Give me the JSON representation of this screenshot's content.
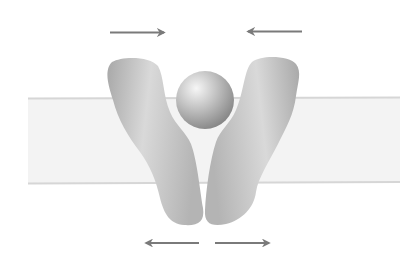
{
  "diagram": {
    "colors": {
      "background": "#ffffff",
      "membrane_fill": "#f3f3f3",
      "membrane_edge": "#d6d6d6",
      "protein_light": "#d2d2d2",
      "protein_dark": "#9e9e9e",
      "substrate_light": "#f2f2f2",
      "substrate_dark": "#8c8c8c",
      "arrow": "#7a7a7a"
    },
    "membrane": {
      "x": 28,
      "y": 98,
      "width": 372,
      "height": 85
    },
    "substrate": {
      "cx": 205,
      "cy": 100,
      "r": 29
    },
    "arrows": {
      "top": [
        {
          "x1": 110,
          "y1": 32,
          "x2": 165,
          "y2": 32,
          "direction": "right"
        },
        {
          "x1": 302,
          "y1": 32,
          "x2": 247,
          "y2": 32,
          "direction": "left"
        }
      ],
      "bottom": [
        {
          "x1": 199,
          "y1": 243,
          "x2": 145,
          "y2": 243,
          "direction": "left"
        },
        {
          "x1": 215,
          "y1": 243,
          "x2": 270,
          "y2": 243,
          "direction": "right"
        }
      ]
    }
  }
}
